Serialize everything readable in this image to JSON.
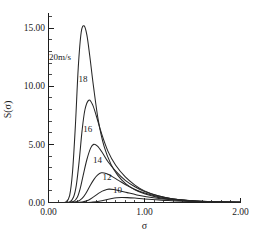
{
  "chart_data": {
    "type": "line",
    "title": "",
    "xlabel": "σ",
    "ylabel": "S(σ)",
    "xlim": [
      0.0,
      2.0
    ],
    "ylim": [
      0.0,
      16.0
    ],
    "grid": false,
    "legend_position": "inline-curve-labels",
    "x_tick_labels": [
      "0.00",
      "1.00",
      "2.00"
    ],
    "x_tick_values": [
      0.0,
      1.0,
      2.0
    ],
    "x_minor_tick_count_per_major": 10,
    "y_tick_labels": [
      "0.00",
      "5.00",
      "10.00",
      "15.00"
    ],
    "y_tick_values": [
      0.0,
      5.0,
      10.0,
      15.0
    ],
    "y_minor_tick_count_per_major": 5,
    "series": [
      {
        "name": "20m/s",
        "label": "20m/s",
        "peak_x": 0.37,
        "peak_y": 15.2,
        "x": [
          0.0,
          0.12,
          0.18,
          0.22,
          0.25,
          0.28,
          0.31,
          0.34,
          0.37,
          0.4,
          0.43,
          0.47,
          0.52,
          0.58,
          0.65,
          0.72,
          0.8,
          0.9,
          1.0,
          1.15,
          1.3,
          1.5,
          1.75,
          2.0
        ],
        "values": [
          0.0,
          0.0,
          0.05,
          0.6,
          2.6,
          6.6,
          11.6,
          14.6,
          15.2,
          14.4,
          12.6,
          9.9,
          7.0,
          4.8,
          3.3,
          2.35,
          1.65,
          1.1,
          0.75,
          0.42,
          0.25,
          0.12,
          0.05,
          0.02
        ]
      },
      {
        "name": "18",
        "label": "18",
        "peak_x": 0.42,
        "peak_y": 8.8,
        "x": [
          0.0,
          0.15,
          0.22,
          0.26,
          0.29,
          0.32,
          0.35,
          0.38,
          0.42,
          0.46,
          0.5,
          0.55,
          0.62,
          0.7,
          0.8,
          0.9,
          1.0,
          1.15,
          1.3,
          1.5,
          1.75,
          2.0
        ],
        "values": [
          0.0,
          0.0,
          0.05,
          0.45,
          1.5,
          3.6,
          6.2,
          8.0,
          8.8,
          8.4,
          7.4,
          6.0,
          4.4,
          3.2,
          2.2,
          1.5,
          1.0,
          0.55,
          0.3,
          0.14,
          0.06,
          0.02
        ]
      },
      {
        "name": "16",
        "label": "16",
        "peak_x": 0.47,
        "peak_y": 5.0,
        "x": [
          0.0,
          0.18,
          0.26,
          0.3,
          0.33,
          0.36,
          0.4,
          0.44,
          0.47,
          0.51,
          0.56,
          0.62,
          0.7,
          0.8,
          0.9,
          1.0,
          1.15,
          1.3,
          1.5,
          1.75,
          2.0
        ],
        "values": [
          0.0,
          0.0,
          0.08,
          0.45,
          1.2,
          2.3,
          3.7,
          4.7,
          5.0,
          4.85,
          4.3,
          3.5,
          2.7,
          1.9,
          1.35,
          0.95,
          0.55,
          0.3,
          0.14,
          0.06,
          0.02
        ]
      },
      {
        "name": "14",
        "label": "14",
        "peak_x": 0.55,
        "peak_y": 2.55,
        "x": [
          0.0,
          0.22,
          0.3,
          0.35,
          0.39,
          0.43,
          0.47,
          0.51,
          0.55,
          0.6,
          0.66,
          0.73,
          0.82,
          0.92,
          1.02,
          1.15,
          1.3,
          1.5,
          1.75,
          2.0
        ],
        "values": [
          0.0,
          0.0,
          0.08,
          0.35,
          0.8,
          1.4,
          1.95,
          2.35,
          2.55,
          2.5,
          2.25,
          1.9,
          1.45,
          1.05,
          0.78,
          0.5,
          0.29,
          0.13,
          0.06,
          0.02
        ]
      },
      {
        "name": "12",
        "label": "12",
        "peak_x": 0.63,
        "peak_y": 1.15,
        "x": [
          0.0,
          0.28,
          0.36,
          0.42,
          0.47,
          0.52,
          0.56,
          0.6,
          0.63,
          0.68,
          0.74,
          0.82,
          0.92,
          1.02,
          1.15,
          1.3,
          1.5,
          1.75,
          2.0
        ],
        "values": [
          0.0,
          0.0,
          0.06,
          0.22,
          0.48,
          0.78,
          0.98,
          1.1,
          1.15,
          1.12,
          1.02,
          0.85,
          0.65,
          0.5,
          0.34,
          0.21,
          0.1,
          0.05,
          0.02
        ]
      },
      {
        "name": "10",
        "label": "10",
        "peak_x": 0.76,
        "peak_y": 0.43,
        "x": [
          0.0,
          0.36,
          0.46,
          0.54,
          0.6,
          0.66,
          0.71,
          0.76,
          0.82,
          0.9,
          1.0,
          1.12,
          1.25,
          1.4,
          1.6,
          1.8,
          2.0
        ],
        "values": [
          0.0,
          0.0,
          0.04,
          0.13,
          0.24,
          0.34,
          0.4,
          0.43,
          0.42,
          0.38,
          0.31,
          0.24,
          0.17,
          0.11,
          0.06,
          0.03,
          0.01
        ]
      }
    ],
    "curve_label_positions": [
      {
        "name": "20m/s",
        "x": 0.12,
        "y": 12.3
      },
      {
        "name": "18",
        "x": 0.36,
        "y": 10.35
      },
      {
        "name": "16",
        "x": 0.41,
        "y": 6.05
      },
      {
        "name": "14",
        "x": 0.51,
        "y": 3.4
      },
      {
        "name": "12",
        "x": 0.61,
        "y": 1.9
      },
      {
        "name": "10",
        "x": 0.72,
        "y": 0.85
      }
    ],
    "line_color": "#262626",
    "axis_color": "#1d1d1d",
    "background_color": "#ffffff"
  }
}
